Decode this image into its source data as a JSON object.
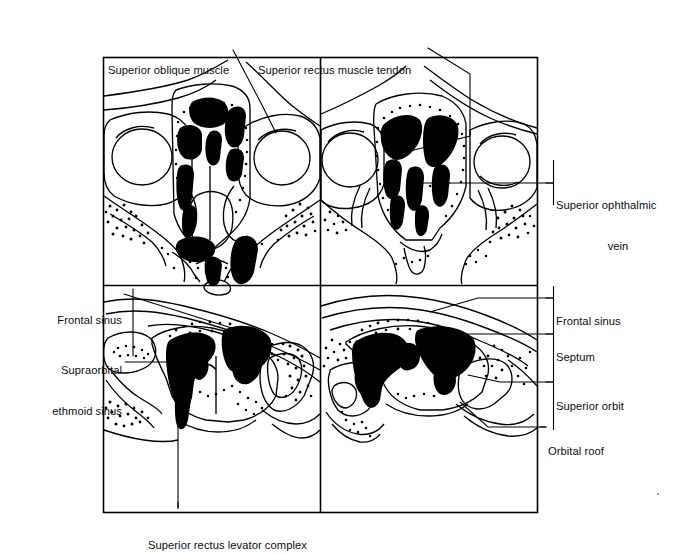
{
  "figure": {
    "panel_count": 4,
    "style": "line-drawing",
    "background_color": "#ffffff",
    "ink_color": "#000000"
  },
  "labels": {
    "superior_oblique_muscle": "Superior oblique muscle",
    "superior_rectus_muscle_tendon": "Superior rectus muscle tendon",
    "superior_ophthalmic_vein_line1": "Superior ophthalmic",
    "superior_ophthalmic_vein_line2": "vein",
    "frontal_sinus_left": "Frontal sinus",
    "supraorbital_ethmoid_sinus_line1": "Supraorbital",
    "supraorbital_ethmoid_sinus_line2": "ethmoid sinus",
    "frontal_sinus_right": "Frontal sinus",
    "septum": "Septum",
    "superior_orbit": "Superior orbit",
    "orbital_roof": "Orbital roof",
    "superior_rectus_levator_complex": "Superior rectus levator complex"
  },
  "panels": [
    {
      "id": "top-left",
      "position": "upper left",
      "bounds": [
        103,
        57,
        320,
        285
      ]
    },
    {
      "id": "top-right",
      "position": "upper right",
      "bounds": [
        320,
        57,
        538,
        285
      ]
    },
    {
      "id": "bottom-left",
      "position": "lower left",
      "bounds": [
        103,
        285,
        320,
        513
      ]
    },
    {
      "id": "bottom-right",
      "position": "lower right",
      "bounds": [
        320,
        285,
        538,
        513
      ]
    }
  ]
}
